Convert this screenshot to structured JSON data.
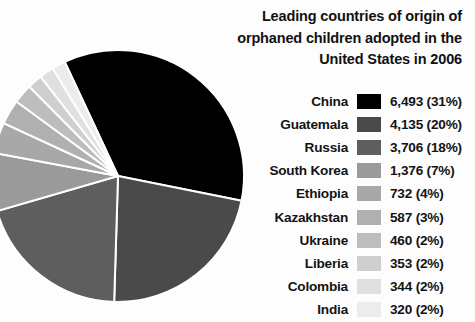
{
  "title": {
    "lines": [
      "Leading countries of origin of",
      "orphaned children adopted in the",
      "United States in 2006"
    ]
  },
  "chart_data": {
    "type": "pie",
    "title": "Leading countries of origin of orphaned children adopted in the United States in 2006",
    "xlabel": "",
    "ylabel": "",
    "legend_position": "right",
    "grid": false,
    "categories": [
      "China",
      "Guatemala",
      "Russia",
      "South Korea",
      "Ethiopia",
      "Kazakhstan",
      "Ukraine",
      "Liberia",
      "Colombia",
      "India"
    ],
    "values": [
      6493,
      4135,
      3706,
      1376,
      732,
      587,
      460,
      353,
      344,
      320
    ],
    "percents": [
      31,
      20,
      18,
      7,
      4,
      3,
      2,
      2,
      2,
      2
    ],
    "value_labels": [
      "6,493 (31%)",
      "4,135 (20%)",
      "3,706 (18%)",
      "1,376 (7%)",
      "732 (4%)",
      "587 (3%)",
      "460 (2%)",
      "353 (2%)",
      "344 (2%)",
      "320 (2%)"
    ],
    "colors": [
      "#000000",
      "#4a4a4a",
      "#5e5e5e",
      "#9a9a9a",
      "#a8a8a8",
      "#b0b0b0",
      "#bdbdbd",
      "#cfcfcf",
      "#e0e0e0",
      "#ececec"
    ],
    "start_angle_deg": -25,
    "direction": "clockwise",
    "slice_border_color": "#ffffff"
  },
  "legend": {
    "rows": [
      {
        "label": "China",
        "value": "6,493 (31%)",
        "color": "#000000"
      },
      {
        "label": "Guatemala",
        "value": "4,135 (20%)",
        "color": "#4a4a4a"
      },
      {
        "label": "Russia",
        "value": "3,706 (18%)",
        "color": "#5e5e5e"
      },
      {
        "label": "South Korea",
        "value": "1,376 (7%)",
        "color": "#9a9a9a"
      },
      {
        "label": "Ethiopia",
        "value": "732 (4%)",
        "color": "#a8a8a8"
      },
      {
        "label": "Kazakhstan",
        "value": "587 (3%)",
        "color": "#b0b0b0"
      },
      {
        "label": "Ukraine",
        "value": "460 (2%)",
        "color": "#bdbdbd"
      },
      {
        "label": "Liberia",
        "value": "353 (2%)",
        "color": "#cfcfcf"
      },
      {
        "label": "Colombia",
        "value": "344 (2%)",
        "color": "#e0e0e0"
      },
      {
        "label": "India",
        "value": "320 (2%)",
        "color": "#ececec"
      }
    ]
  }
}
